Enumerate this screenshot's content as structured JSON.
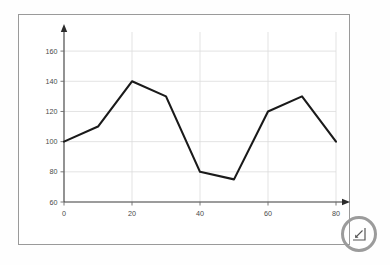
{
  "chart_data": {
    "type": "line",
    "title": "",
    "xlabel": "",
    "ylabel": "",
    "x": [
      0,
      10,
      20,
      30,
      40,
      50,
      60,
      70,
      80
    ],
    "values": [
      100,
      110,
      140,
      130,
      80,
      75,
      120,
      130,
      100
    ],
    "series": [
      {
        "name": "series-1",
        "values": [
          100,
          110,
          140,
          130,
          80,
          75,
          120,
          130,
          100
        ]
      }
    ],
    "xlim": [
      0,
      80
    ],
    "ylim": [
      60,
      170
    ],
    "x_ticks": [
      0,
      20,
      40,
      60,
      80
    ],
    "x_tick_labels": [
      "0",
      "20",
      "40",
      "60",
      "80"
    ],
    "y_ticks": [
      60,
      80,
      100,
      120,
      140,
      160
    ],
    "y_tick_labels": [
      "60",
      "80",
      "100",
      "120",
      "140",
      "160"
    ],
    "grid": true,
    "grid_color": "#dcdcdc",
    "legend": false,
    "legend_position": "none",
    "line_color": "#1a1a1a",
    "axis_color": "#3a3a3a",
    "axis_arrows": true
  },
  "overlay": {
    "cursor_ring_color": "#9b9b9b",
    "cursor_icon": "resize-handle-icon"
  },
  "frame": {
    "border_color": "#9a9a9a",
    "background": "#ffffff"
  }
}
